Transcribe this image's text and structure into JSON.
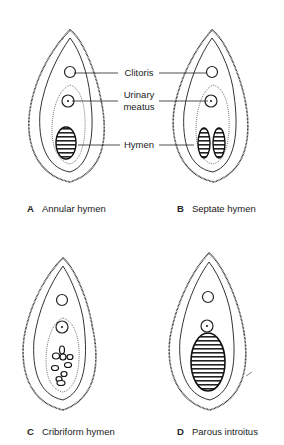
{
  "figures": [
    {
      "letter": "A",
      "title": "Annular hymen",
      "variant": "annular"
    },
    {
      "letter": "B",
      "title": "Septate hymen",
      "variant": "septate"
    },
    {
      "letter": "C",
      "title": "Cribriform hymen",
      "variant": "cribriform"
    },
    {
      "letter": "D",
      "title": "Parous introitus",
      "variant": "parous"
    }
  ],
  "callouts": {
    "clitoris": "Clitoris",
    "urinary_meatus_line1": "Urinary",
    "urinary_meatus_line2": "meatus",
    "hymen": "Hymen"
  },
  "colors": {
    "ink": "#1a1a1a",
    "background": "#ffffff"
  }
}
